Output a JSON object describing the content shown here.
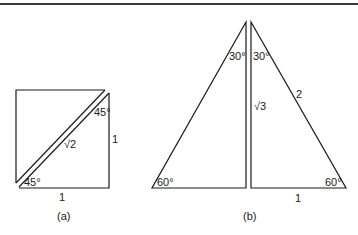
{
  "figure": {
    "top_rule": true,
    "panel_a": {
      "caption": "(a)",
      "labels": {
        "angle_top": "45°",
        "angle_bottom": "45°",
        "hypotenuse": "√2",
        "side_right": "1",
        "side_bottom": "1"
      }
    },
    "panel_b": {
      "caption": "(b)",
      "labels": {
        "angle_top_left": "30°",
        "angle_top_right": "30°",
        "height": "√3",
        "hypotenuse": "2",
        "angle_bottom_left": "60°",
        "angle_bottom_right": "60°",
        "base": "1"
      }
    }
  },
  "colors": {
    "stroke": "#1a1a1a",
    "background": "#ffffff"
  }
}
